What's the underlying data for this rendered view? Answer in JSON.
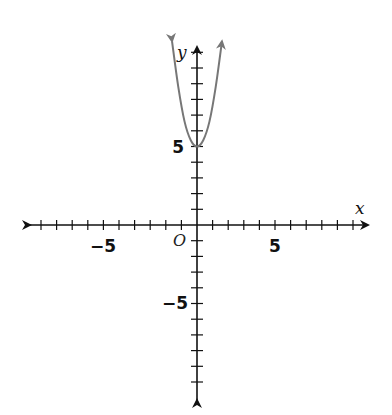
{
  "chart_data": {
    "type": "line",
    "title": "",
    "xlabel": "x",
    "ylabel": "y",
    "origin_label": "O",
    "xlim": [
      -10.5,
      11
    ],
    "ylim": [
      -11.5,
      11.5
    ],
    "x_ticks_step": 1,
    "y_ticks_step": 1,
    "x_tick_labels": [
      {
        "value": -5,
        "label": "−5"
      },
      {
        "value": 5,
        "label": "5"
      }
    ],
    "y_tick_labels": [
      {
        "value": 5,
        "label": "5"
      },
      {
        "value": -5,
        "label": "−5"
      }
    ],
    "grid": false,
    "legend": null,
    "series": [
      {
        "name": "parabola",
        "description": "Upward-opening parabola with vertex at (0, 5), arrows on both arms",
        "vertex": [
          0,
          5
        ],
        "color": "#777777",
        "x": [
          -1.6,
          -1.2,
          -0.8,
          -0.4,
          0,
          0.4,
          0.8,
          1.2,
          1.6
        ],
        "values": [
          11.7,
          8.8,
          6.6,
          5.4,
          5,
          5.4,
          6.6,
          8.8,
          11.7
        ]
      }
    ]
  },
  "labels": {
    "x_axis": "x",
    "y_axis": "y",
    "origin": "O",
    "x_neg5": "−5",
    "x_pos5": "5",
    "y_pos5": "5",
    "y_neg5": "−5"
  },
  "colors": {
    "axis": "#111111",
    "curve": "#777777",
    "background": "#ffffff"
  }
}
